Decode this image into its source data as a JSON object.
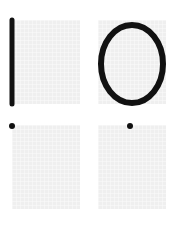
{
  "figure": {
    "background": "#ffffff",
    "panel_fill": "#efefef",
    "stroke_color": "#111111",
    "panels": [
      {
        "id": "top-left",
        "shape": "vertical-line",
        "description": "thick vertical stroke along left edge"
      },
      {
        "id": "top-right",
        "shape": "ellipse",
        "description": "thick outlined ellipse filling panel"
      },
      {
        "id": "bottom-left",
        "shape": "dot",
        "description": "single dot at top-left corner"
      },
      {
        "id": "bottom-right",
        "shape": "dot",
        "description": "single dot at top-center"
      }
    ]
  }
}
